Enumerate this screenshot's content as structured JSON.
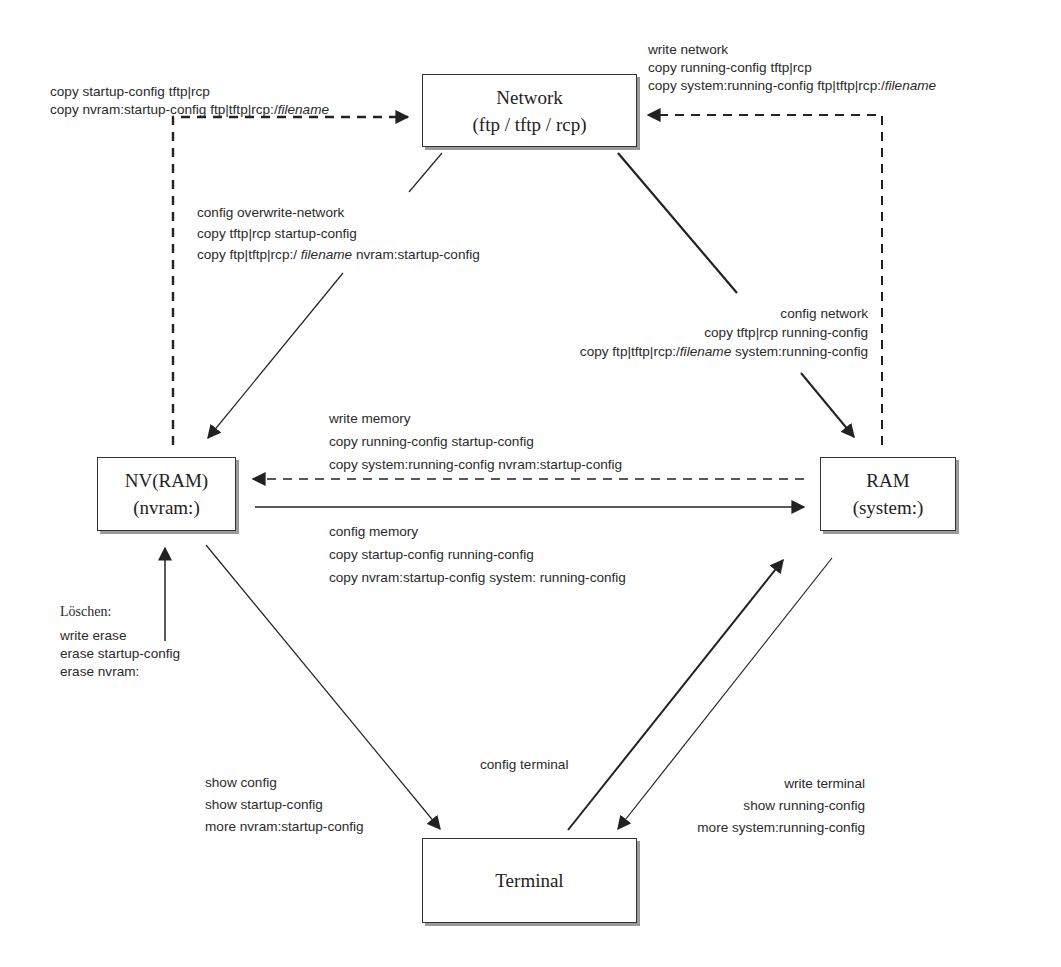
{
  "nodes": {
    "network": {
      "line1": "Network",
      "line2": "(ftp / tftp / rcp)"
    },
    "nvram": {
      "line1": "NV(RAM)",
      "line2": "(nvram:)"
    },
    "ram": {
      "line1": "RAM",
      "line2": "(system:)"
    },
    "terminal": {
      "line1": "Terminal"
    }
  },
  "labels": {
    "nvram_to_network": {
      "l1": "copy startup-config  tftp|rcp",
      "l2_prefix": "copy nvram:startup-config  ftp|tftp|rcp:/",
      "l2_italic": "filename"
    },
    "ram_to_network": {
      "l1": "write network",
      "l2": "copy running-config  tftp|rcp",
      "l3_prefix": "copy system:running-config ftp|tftp|rcp:/",
      "l3_italic": "filename"
    },
    "network_to_nvram": {
      "l1": "config overwrite-network",
      "l2": "copy tftp|rcp startup-config",
      "l3_prefix": "copy ftp|tftp|rcp:/ ",
      "l3_italic": "filename",
      "l3_suffix": "  nvram:startup-config"
    },
    "network_to_ram": {
      "l1": "config network",
      "l2": "copy tftp|rcp  running-config",
      "l3_prefix": "copy ftp|tftp|rcp:/",
      "l3_italic": "filename",
      "l3_suffix": " system:running-config"
    },
    "ram_to_nvram": {
      "l1": "write memory",
      "l2": "copy running-config startup-config",
      "l3": "copy system:running-config nvram:startup-config"
    },
    "nvram_to_ram": {
      "l1": "config memory",
      "l2": "copy startup-config  running-config",
      "l3": "copy nvram:startup-config  system: running-config"
    },
    "erase": {
      "heading": "Löschen:",
      "l1": "write erase",
      "l2": "erase startup-config",
      "l3": "erase nvram:"
    },
    "nvram_to_terminal": {
      "l1": "show config",
      "l2": "show startup-config",
      "l3": "more nvram:startup-config"
    },
    "terminal_to_ram": {
      "l1": "config terminal"
    },
    "ram_to_terminal": {
      "l1": "write terminal",
      "l2": "show running-config",
      "l3": "more system:running-config"
    }
  },
  "colors": {
    "line": "#222222",
    "shadow": "#9a9a9a",
    "text": "#2a2a2a"
  }
}
